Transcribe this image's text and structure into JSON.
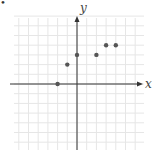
{
  "chart_data": {
    "type": "scatter",
    "title": "",
    "xlabel": "x",
    "ylabel": "y",
    "xlim": [
      -7,
      7
    ],
    "ylim": [
      -7,
      7
    ],
    "grid": true,
    "tick_labels": false,
    "points": [
      {
        "x": -2,
        "y": 0
      },
      {
        "x": -1,
        "y": 2
      },
      {
        "x": 0,
        "y": 3
      },
      {
        "x": 2,
        "y": 3
      },
      {
        "x": 3,
        "y": 4
      },
      {
        "x": 4,
        "y": 4
      }
    ],
    "colors": {
      "grid": "#e6e6e6",
      "axis": "#333333",
      "point": "#555555"
    }
  },
  "bullet": "•"
}
